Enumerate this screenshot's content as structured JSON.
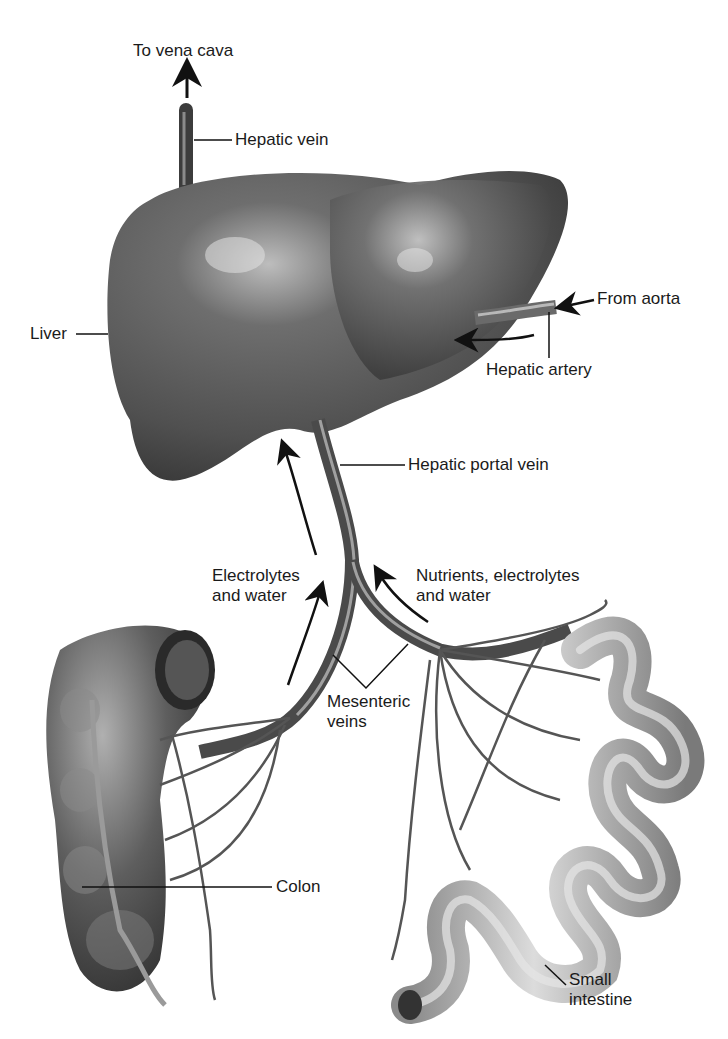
{
  "diagram": {
    "type": "anatomical-diagram",
    "colors": {
      "organ_dark": "#4a4a4a",
      "organ_mid": "#7a7a7a",
      "highlight": "#cfcfcf",
      "intestine": "#a8a8a8",
      "text": "#1a1a1a",
      "background": "#ffffff"
    },
    "labels": {
      "to_vena_cava": "To vena cava",
      "hepatic_vein": "Hepatic vein",
      "liver": "Liver",
      "from_aorta": "From aorta",
      "hepatic_artery": "Hepatic artery",
      "hepatic_portal_vein": "Hepatic portal vein",
      "electrolytes_water_line1": "Electrolytes",
      "electrolytes_water_line2": "and water",
      "nutrients_line1": "Nutrients, electrolytes",
      "nutrients_line2": "and water",
      "mesenteric_line1": "Mesenteric",
      "mesenteric_line2": "veins",
      "colon": "Colon",
      "small_intestine_line1": "Small",
      "small_intestine_line2": "intestine"
    },
    "flow_arrows": [
      {
        "name": "to-vena-cava-arrow",
        "direction": "up"
      },
      {
        "name": "hepatic-artery-flow-arrow",
        "direction": "left"
      },
      {
        "name": "portal-vein-flow-arrow",
        "direction": "up"
      },
      {
        "name": "colon-flow-arrow",
        "direction": "up"
      },
      {
        "name": "intestine-flow-arrow",
        "direction": "up-left"
      },
      {
        "name": "from-aorta-arrow",
        "direction": "left"
      }
    ]
  }
}
